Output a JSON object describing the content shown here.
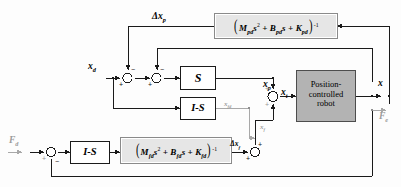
{
  "diagram": {
    "colors": {
      "line": "#1a1a1a",
      "gray_line": "#a8a8a8",
      "block_fill": "#e6e6e6",
      "robot_fill": "#b3b3b3",
      "white": "#ffffff"
    }
  },
  "blocks": {
    "position_admittance": {
      "name": "position-admittance-block",
      "expr_open": "(",
      "m_sym": "M",
      "m_sub": "pd",
      "m_pow": "2",
      "plus1": "+",
      "b_sym": "B",
      "b_sub": "pd",
      "plus2": "+",
      "k_sym": "K",
      "k_sub": "pd",
      "expr_close": ")",
      "exponent": "-1",
      "s_var": "s"
    },
    "force_admittance": {
      "name": "force-admittance-block",
      "expr_open": "(",
      "m_sym": "M",
      "m_sub": "fd",
      "m_pow": "2",
      "plus1": "+",
      "b_sym": "B",
      "b_sub": "fd",
      "plus2": "+",
      "k_sym": "K",
      "k_sub": "fd",
      "expr_close": ")",
      "exponent": "-1",
      "s_var": "s"
    },
    "selection_s": {
      "name": "selection-matrix-s-block",
      "label": "S"
    },
    "selection_is_top": {
      "name": "selection-matrix-i-minus-s-block-top",
      "label": "I-S"
    },
    "selection_is_bottom": {
      "name": "selection-matrix-i-minus-s-block-bottom",
      "label": "I-S"
    },
    "robot": {
      "name": "position-controlled-robot-block",
      "line1": "Position-",
      "line2": "controlled",
      "line3": "robot"
    }
  },
  "signals": {
    "delta_xp": {
      "base": "Δx",
      "sub": "p"
    },
    "xd": {
      "base": "x",
      "sub": "d"
    },
    "xp": {
      "base": "x",
      "sub": "p"
    },
    "xt": {
      "base": "x",
      "sub": "t"
    },
    "xfd": {
      "base": "x",
      "sub": "fd"
    },
    "xf": {
      "base": "x",
      "sub": "f"
    },
    "delta_xf": {
      "base": "Δx",
      "sub": "f"
    },
    "fd": {
      "base": "F",
      "sub": "d"
    },
    "fe": {
      "base": "F",
      "sub": "e"
    },
    "x_out": {
      "base": "x",
      "sub": ""
    }
  },
  "summing_junctions": [
    {
      "name": "sum-junction-xd-1",
      "signs": {
        "left": "+",
        "top": "-"
      }
    },
    {
      "name": "sum-junction-xd-2",
      "signs": {
        "left": "+",
        "top": "-"
      }
    },
    {
      "name": "sum-junction-position",
      "signs": {
        "top": "+",
        "bottom": "+"
      }
    },
    {
      "name": "sum-junction-force-out",
      "signs": {
        "left": "+",
        "top": "+"
      }
    },
    {
      "name": "sum-junction-force-in",
      "signs": {
        "left": "+",
        "bottom": "-"
      }
    }
  ]
}
